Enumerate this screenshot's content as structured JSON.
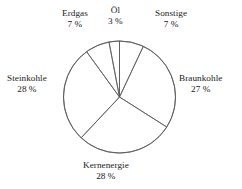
{
  "chart_data": {
    "type": "pie",
    "title": "",
    "subtitle": "",
    "xlabel": "",
    "ylabel": "",
    "legend_position": "none",
    "grid": false,
    "unit": "%",
    "total": 100,
    "start_angle_deg": 0,
    "direction": "clockwise",
    "categories": [
      "Sonstige",
      "Braunkohle",
      "Kernenergie",
      "Steinkohle",
      "Erdgas",
      "Öl"
    ],
    "values": [
      7,
      27,
      28,
      28,
      7,
      3
    ],
    "slices": [
      {
        "name": "Sonstige",
        "value": 7,
        "value_label": "7 %",
        "label_x": 155,
        "label_y": 8,
        "color": "#ffffff",
        "stroke": "#595959"
      },
      {
        "name": "Braunkohle",
        "value": 27,
        "value_label": "27 %",
        "label_x": 179,
        "label_y": 73,
        "color": "#ffffff",
        "stroke": "#595959"
      },
      {
        "name": "Kernenergie",
        "value": 28,
        "value_label": "28 %",
        "label_x": 83,
        "label_y": 160,
        "color": "#ffffff",
        "stroke": "#595959"
      },
      {
        "name": "Steinkohle",
        "value": 28,
        "value_label": "28 %",
        "label_x": 7,
        "label_y": 73,
        "color": "#ffffff",
        "stroke": "#595959"
      },
      {
        "name": "Erdgas",
        "value": 7,
        "value_label": "7 %",
        "label_x": 62,
        "label_y": 8,
        "color": "#ffffff",
        "stroke": "#595959"
      },
      {
        "name": "Öl",
        "value": 3,
        "value_label": "3 %",
        "label_x": 108,
        "label_y": 5,
        "color": "#ffffff",
        "stroke": "#595959"
      }
    ],
    "geometry": {
      "center_x": 119.5,
      "center_y": 97,
      "radius": 56
    },
    "colors": {
      "stroke": "#595959",
      "fill": "#ffffff",
      "text": "#1a1a1a",
      "background": "#ffffff"
    }
  }
}
